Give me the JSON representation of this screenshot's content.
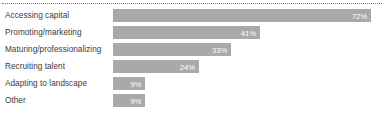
{
  "chart_data": {
    "type": "bar",
    "orientation": "horizontal",
    "title": "",
    "subtitle": "",
    "xlabel": "",
    "ylabel": "",
    "xlim": [
      0,
      75
    ],
    "grid": false,
    "legend": null,
    "value_label_suffix": "%",
    "categories": [
      "Accessing capital",
      "Promoting/marketing",
      "Maturing/professionalizing",
      "Recruiting talent",
      "Adapting to landscape",
      "Other"
    ],
    "values": [
      72,
      41,
      33,
      24,
      9,
      9
    ],
    "value_labels": [
      "72%",
      "41%",
      "33%",
      "24%",
      "9%",
      "9%"
    ],
    "colors": {
      "bar": "#a9a9a9",
      "value_text": "#ffffff",
      "category_text": "#3b3b3b",
      "rule": "#7d7d7d",
      "background": "#ffffff"
    }
  }
}
